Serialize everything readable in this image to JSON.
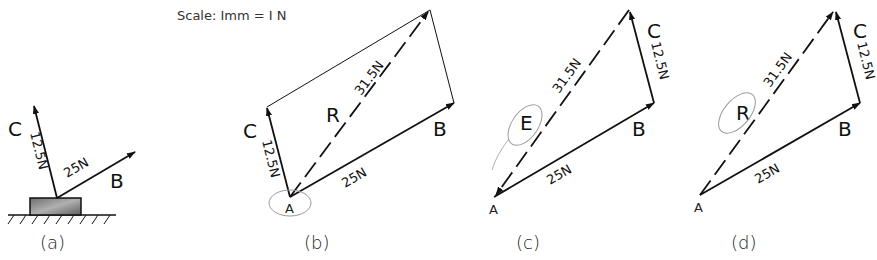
{
  "scale_note": "Scale: Imm = I N",
  "colors": {
    "ink": "#111111",
    "annotation": "#9a9a9a",
    "block_fill": "#8c8c8c"
  },
  "panels": {
    "a": {
      "caption": "(a)",
      "force_c": {
        "label": "C",
        "magnitude": "12.5N"
      },
      "force_b": {
        "label": "B",
        "magnitude": "25N"
      }
    },
    "b": {
      "caption": "(b)",
      "point": "A",
      "force_c": {
        "label": "C",
        "magnitude": "12.5N"
      },
      "force_b": {
        "label": "B",
        "magnitude": "25N"
      },
      "resultant": {
        "label": "R",
        "magnitude": "31.5N"
      }
    },
    "c": {
      "caption": "(c)",
      "point": "A",
      "force_c": {
        "label": "C",
        "magnitude": "12.5N"
      },
      "force_b": {
        "label": "B",
        "magnitude": "25N"
      },
      "equilibrant": {
        "label": "E",
        "magnitude": "31.5N"
      }
    },
    "d": {
      "caption": "(d)",
      "point": "A",
      "force_c": {
        "label": "C",
        "magnitude": "12.5N"
      },
      "force_b": {
        "label": "B",
        "magnitude": "25N"
      },
      "resultant": {
        "label": "R",
        "magnitude": "31.5N"
      }
    }
  }
}
